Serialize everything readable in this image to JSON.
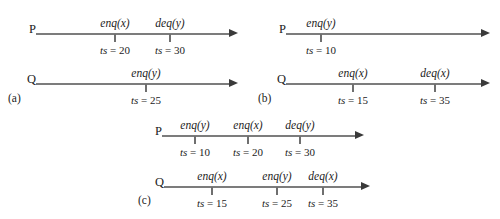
{
  "figure": {
    "width": 500,
    "height": 219,
    "background": "#ffffff",
    "line_color": "#7c7c7c",
    "tick_color": "#6f6f6f",
    "text_color": "#1c1c1c",
    "ts_key": "ts",
    "ts_sep": " = "
  },
  "panels": [
    {
      "id": "a",
      "caption": "(a)",
      "caption_x": 8,
      "caption_y": 92,
      "timelines": [
        {
          "id": "a-P",
          "process": "P",
          "label_x": 20,
          "y": 33,
          "line_x": 36,
          "line_w": 202,
          "events": [
            {
              "op": "enq(x)",
              "ts": "20",
              "x": 79
            },
            {
              "op": "deq(y)",
              "ts": "30",
              "x": 134
            }
          ]
        },
        {
          "id": "a-Q",
          "process": "Q",
          "label_x": 20,
          "y": 83,
          "line_x": 36,
          "line_w": 202,
          "events": [
            {
              "op": "enq(y)",
              "ts": "25",
              "x": 110
            }
          ]
        }
      ]
    },
    {
      "id": "b",
      "caption": "(b)",
      "caption_x": 258,
      "caption_y": 92,
      "timelines": [
        {
          "id": "b-P",
          "process": "P",
          "label_x": 270,
          "y": 33,
          "line_x": 286,
          "line_w": 204,
          "events": [
            {
              "op": "enq(y)",
              "ts": "10",
              "x": 35
            }
          ]
        },
        {
          "id": "b-Q",
          "process": "Q",
          "label_x": 270,
          "y": 83,
          "line_x": 286,
          "line_w": 204,
          "events": [
            {
              "op": "enq(x)",
              "ts": "15",
              "x": 67
            },
            {
              "op": "deq(x)",
              "ts": "35",
              "x": 149
            }
          ]
        }
      ]
    },
    {
      "id": "c",
      "caption": "(c)",
      "caption_x": 138,
      "caption_y": 194,
      "timelines": [
        {
          "id": "c-P",
          "process": "P",
          "label_x": 146,
          "y": 135,
          "line_x": 162,
          "line_w": 202,
          "events": [
            {
              "op": "enq(y)",
              "ts": "10",
              "x": 33
            },
            {
              "op": "enq(x)",
              "ts": "20",
              "x": 86
            },
            {
              "op": "deq(y)",
              "ts": "30",
              "x": 138
            }
          ]
        },
        {
          "id": "c-Q",
          "process": "Q",
          "label_x": 148,
          "y": 186,
          "line_x": 164,
          "line_w": 206,
          "events": [
            {
              "op": "enq(x)",
              "ts": "15",
              "x": 48
            },
            {
              "op": "enq(y)",
              "ts": "25",
              "x": 113
            },
            {
              "op": "deq(x)",
              "ts": "35",
              "x": 159
            }
          ]
        }
      ]
    }
  ]
}
